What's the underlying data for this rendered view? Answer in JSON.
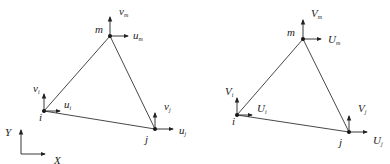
{
  "diagrams": [
    {
      "name": "local-element",
      "nodes": {
        "m": {
          "label": "m",
          "x": 110,
          "y": 36
        },
        "i": {
          "label": "i",
          "x": 44,
          "y": 111
        },
        "j": {
          "label": "j",
          "x": 155,
          "y": 129
        }
      },
      "labels": {
        "v_m": {
          "base": "v",
          "sub": "m"
        },
        "u_m": {
          "base": "u",
          "sub": "m"
        },
        "v_i": {
          "base": "v",
          "sub": "i"
        },
        "u_i": {
          "base": "u",
          "sub": "i"
        },
        "v_j": {
          "base": "v",
          "sub": "j"
        },
        "u_j": {
          "base": "u",
          "sub": "j"
        }
      }
    },
    {
      "name": "global-element",
      "nodes": {
        "m": {
          "label": "m",
          "x": 303,
          "y": 39
        },
        "i": {
          "label": "i",
          "x": 237,
          "y": 115
        },
        "j": {
          "label": "j",
          "x": 349,
          "y": 132
        }
      },
      "labels": {
        "V_m": {
          "base": "V",
          "sub": "m"
        },
        "U_m": {
          "base": "U",
          "sub": "m"
        },
        "V_i": {
          "base": "V",
          "sub": "i"
        },
        "U_i": {
          "base": "U",
          "sub": "i"
        },
        "V_j": {
          "base": "V",
          "sub": "j"
        },
        "U_j": {
          "base": "U",
          "sub": "j"
        }
      }
    }
  ],
  "axes": {
    "x_label": "X",
    "y_label": "Y"
  }
}
